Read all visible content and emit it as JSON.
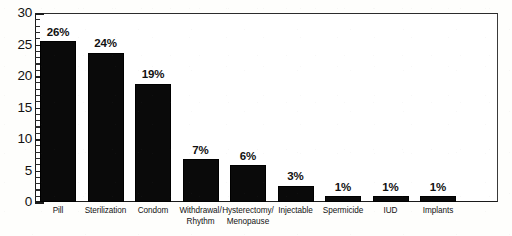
{
  "chart_data": {
    "type": "bar",
    "title": "",
    "subtitle": "",
    "xlabel": "",
    "ylabel": "",
    "ylim": [
      0,
      30
    ],
    "y_ticks": [
      0,
      5,
      10,
      15,
      20,
      25,
      30
    ],
    "y_tick_labels": [
      "0",
      "5",
      "10",
      "15",
      "20",
      "25",
      "30"
    ],
    "y_minor_tick_interval": 1,
    "grid": false,
    "legend": "none",
    "bar_color": "#0a0a0a",
    "background_color": "#fefefc",
    "axis_color": "#1a1a1a",
    "categories": [
      "Pill",
      "Sterilization",
      "Condom",
      "Withdrawal/\nRhythm",
      "Hysterectomy/\nMenopause",
      "Injectable",
      "Spermicide",
      "IUD",
      "Implants"
    ],
    "values": [
      25.5,
      23.7,
      18.8,
      6.8,
      5.8,
      2.6,
      0.9,
      0.9,
      0.9
    ],
    "data_labels": [
      "26%",
      "24%",
      "19%",
      "7%",
      "6%",
      "3%",
      "1%",
      "1%",
      "1%"
    ],
    "series": [
      {
        "name": "Share of contraceptive use",
        "values": [
          25.5,
          23.7,
          18.8,
          6.8,
          5.8,
          2.6,
          0.9,
          0.9,
          0.9
        ]
      }
    ]
  }
}
